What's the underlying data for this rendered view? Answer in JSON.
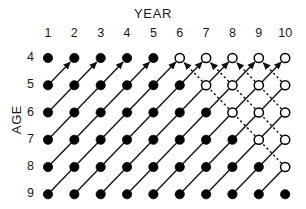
{
  "figure": {
    "kind": "lexis-diagram",
    "width": 306,
    "height": 209,
    "background": "#ffffff",
    "ink_color": "#000000"
  },
  "axes": {
    "x_title": "YEAR",
    "y_title": "AGE",
    "x_ticks": [
      "1",
      "2",
      "3",
      "4",
      "5",
      "6",
      "7",
      "8",
      "9",
      "10"
    ],
    "y_ticks": [
      "4",
      "5",
      "6",
      "7",
      "8",
      "9"
    ]
  },
  "chart_data": {
    "type": "scatter",
    "title": "",
    "subtitle": "",
    "xlabel": "YEAR",
    "ylabel": "AGE",
    "x": [
      1,
      2,
      3,
      4,
      5,
      6,
      7,
      8,
      9,
      10
    ],
    "y": [
      4,
      5,
      6,
      7,
      8,
      9
    ],
    "xlim": [
      1,
      10
    ],
    "ylim": [
      4,
      9
    ],
    "y_axis_direction": "downward",
    "grid": false,
    "legend": null,
    "marker_styles": {
      "observed": {
        "name": "filled-circle",
        "fill": "#000000",
        "stroke": "#000000",
        "radius": 4.6
      },
      "projected": {
        "name": "open-circle",
        "fill": "#ffffff",
        "stroke": "#000000",
        "radius": 4.6,
        "stroke_width": 1.5
      }
    },
    "cohort_line_styles": {
      "observed": {
        "name": "solid-line",
        "stroke": "#1a1a1a",
        "stroke_width": 1.5,
        "dash": null
      },
      "projected": {
        "name": "dashed-line",
        "stroke": "#1a1a1a",
        "stroke_width": 1.5,
        "dash": "2.2 2.6"
      }
    },
    "fill_rule": "point (year, age) is observed/filled when year - age <= 1; otherwise projected/open",
    "points": [
      {
        "year": 1,
        "age": 4,
        "state": "observed"
      },
      {
        "year": 2,
        "age": 4,
        "state": "observed"
      },
      {
        "year": 3,
        "age": 4,
        "state": "observed"
      },
      {
        "year": 4,
        "age": 4,
        "state": "observed"
      },
      {
        "year": 5,
        "age": 4,
        "state": "observed"
      },
      {
        "year": 6,
        "age": 4,
        "state": "projected"
      },
      {
        "year": 7,
        "age": 4,
        "state": "projected"
      },
      {
        "year": 8,
        "age": 4,
        "state": "projected"
      },
      {
        "year": 9,
        "age": 4,
        "state": "projected"
      },
      {
        "year": 10,
        "age": 4,
        "state": "projected"
      },
      {
        "year": 1,
        "age": 5,
        "state": "observed"
      },
      {
        "year": 2,
        "age": 5,
        "state": "observed"
      },
      {
        "year": 3,
        "age": 5,
        "state": "observed"
      },
      {
        "year": 4,
        "age": 5,
        "state": "observed"
      },
      {
        "year": 5,
        "age": 5,
        "state": "observed"
      },
      {
        "year": 6,
        "age": 5,
        "state": "observed"
      },
      {
        "year": 7,
        "age": 5,
        "state": "projected"
      },
      {
        "year": 8,
        "age": 5,
        "state": "projected"
      },
      {
        "year": 9,
        "age": 5,
        "state": "projected"
      },
      {
        "year": 10,
        "age": 5,
        "state": "projected"
      },
      {
        "year": 1,
        "age": 6,
        "state": "observed"
      },
      {
        "year": 2,
        "age": 6,
        "state": "observed"
      },
      {
        "year": 3,
        "age": 6,
        "state": "observed"
      },
      {
        "year": 4,
        "age": 6,
        "state": "observed"
      },
      {
        "year": 5,
        "age": 6,
        "state": "observed"
      },
      {
        "year": 6,
        "age": 6,
        "state": "observed"
      },
      {
        "year": 7,
        "age": 6,
        "state": "observed"
      },
      {
        "year": 8,
        "age": 6,
        "state": "projected"
      },
      {
        "year": 9,
        "age": 6,
        "state": "projected"
      },
      {
        "year": 10,
        "age": 6,
        "state": "projected"
      },
      {
        "year": 1,
        "age": 7,
        "state": "observed"
      },
      {
        "year": 2,
        "age": 7,
        "state": "observed"
      },
      {
        "year": 3,
        "age": 7,
        "state": "observed"
      },
      {
        "year": 4,
        "age": 7,
        "state": "observed"
      },
      {
        "year": 5,
        "age": 7,
        "state": "observed"
      },
      {
        "year": 6,
        "age": 7,
        "state": "observed"
      },
      {
        "year": 7,
        "age": 7,
        "state": "observed"
      },
      {
        "year": 8,
        "age": 7,
        "state": "observed"
      },
      {
        "year": 9,
        "age": 7,
        "state": "projected"
      },
      {
        "year": 10,
        "age": 7,
        "state": "projected"
      },
      {
        "year": 1,
        "age": 8,
        "state": "observed"
      },
      {
        "year": 2,
        "age": 8,
        "state": "observed"
      },
      {
        "year": 3,
        "age": 8,
        "state": "observed"
      },
      {
        "year": 4,
        "age": 8,
        "state": "observed"
      },
      {
        "year": 5,
        "age": 8,
        "state": "observed"
      },
      {
        "year": 6,
        "age": 8,
        "state": "observed"
      },
      {
        "year": 7,
        "age": 8,
        "state": "observed"
      },
      {
        "year": 8,
        "age": 8,
        "state": "observed"
      },
      {
        "year": 9,
        "age": 8,
        "state": "observed"
      },
      {
        "year": 10,
        "age": 8,
        "state": "projected"
      },
      {
        "year": 1,
        "age": 9,
        "state": "observed"
      },
      {
        "year": 2,
        "age": 9,
        "state": "observed"
      },
      {
        "year": 3,
        "age": 9,
        "state": "observed"
      },
      {
        "year": 4,
        "age": 9,
        "state": "observed"
      },
      {
        "year": 5,
        "age": 9,
        "state": "observed"
      },
      {
        "year": 6,
        "age": 9,
        "state": "observed"
      },
      {
        "year": 7,
        "age": 9,
        "state": "observed"
      },
      {
        "year": 8,
        "age": 9,
        "state": "observed"
      },
      {
        "year": 9,
        "age": 9,
        "state": "observed"
      },
      {
        "year": 10,
        "age": 9,
        "state": "observed"
      }
    ],
    "cohorts": [
      {
        "id": "c-4",
        "start": {
          "year": 1,
          "age": 9
        },
        "end": {
          "year": 6,
          "age": 4
        },
        "style": "observed",
        "arrowhead": true
      },
      {
        "id": "c-3",
        "start": {
          "year": 1,
          "age": 8
        },
        "end": {
          "year": 5,
          "age": 4
        },
        "style": "observed",
        "arrowhead": true
      },
      {
        "id": "c-2",
        "start": {
          "year": 1,
          "age": 7
        },
        "end": {
          "year": 4,
          "age": 4
        },
        "style": "observed",
        "arrowhead": true
      },
      {
        "id": "c-1",
        "start": {
          "year": 1,
          "age": 6
        },
        "end": {
          "year": 3,
          "age": 4
        },
        "style": "observed",
        "arrowhead": true
      },
      {
        "id": "c0",
        "start": {
          "year": 1,
          "age": 5
        },
        "end": {
          "year": 2,
          "age": 4
        },
        "style": "observed",
        "arrowhead": true
      },
      {
        "id": "c1",
        "start": {
          "year": 2,
          "age": 9
        },
        "end": {
          "year": 7,
          "age": 4
        },
        "style": "observed",
        "arrowhead": true
      },
      {
        "id": "c2",
        "start": {
          "year": 3,
          "age": 9
        },
        "end": {
          "year": 8,
          "age": 4
        },
        "style": "observed",
        "arrowhead": true
      },
      {
        "id": "c3",
        "start": {
          "year": 4,
          "age": 9
        },
        "end": {
          "year": 9,
          "age": 4
        },
        "style": "observed",
        "arrowhead": true
      },
      {
        "id": "c4",
        "start": {
          "year": 5,
          "age": 9
        },
        "end": {
          "year": 10,
          "age": 4
        },
        "style": "observed",
        "arrowhead": true
      },
      {
        "id": "c5",
        "start": {
          "year": 6,
          "age": 9
        },
        "end": {
          "year": 10,
          "age": 5
        },
        "style": "observed",
        "arrowhead": false
      },
      {
        "id": "c6",
        "start": {
          "year": 7,
          "age": 9
        },
        "end": {
          "year": 10,
          "age": 6
        },
        "style": "observed",
        "arrowhead": false
      },
      {
        "id": "c7",
        "start": {
          "year": 8,
          "age": 9
        },
        "end": {
          "year": 10,
          "age": 7
        },
        "style": "observed",
        "arrowhead": false
      },
      {
        "id": "c8",
        "start": {
          "year": 9,
          "age": 9
        },
        "end": {
          "year": 10,
          "age": 8
        },
        "style": "observed",
        "arrowhead": false
      }
    ],
    "annotations": [
      {
        "text": "YEAR",
        "role": "x-axis-title"
      },
      {
        "text": "AGE",
        "role": "y-axis-title"
      }
    ]
  }
}
